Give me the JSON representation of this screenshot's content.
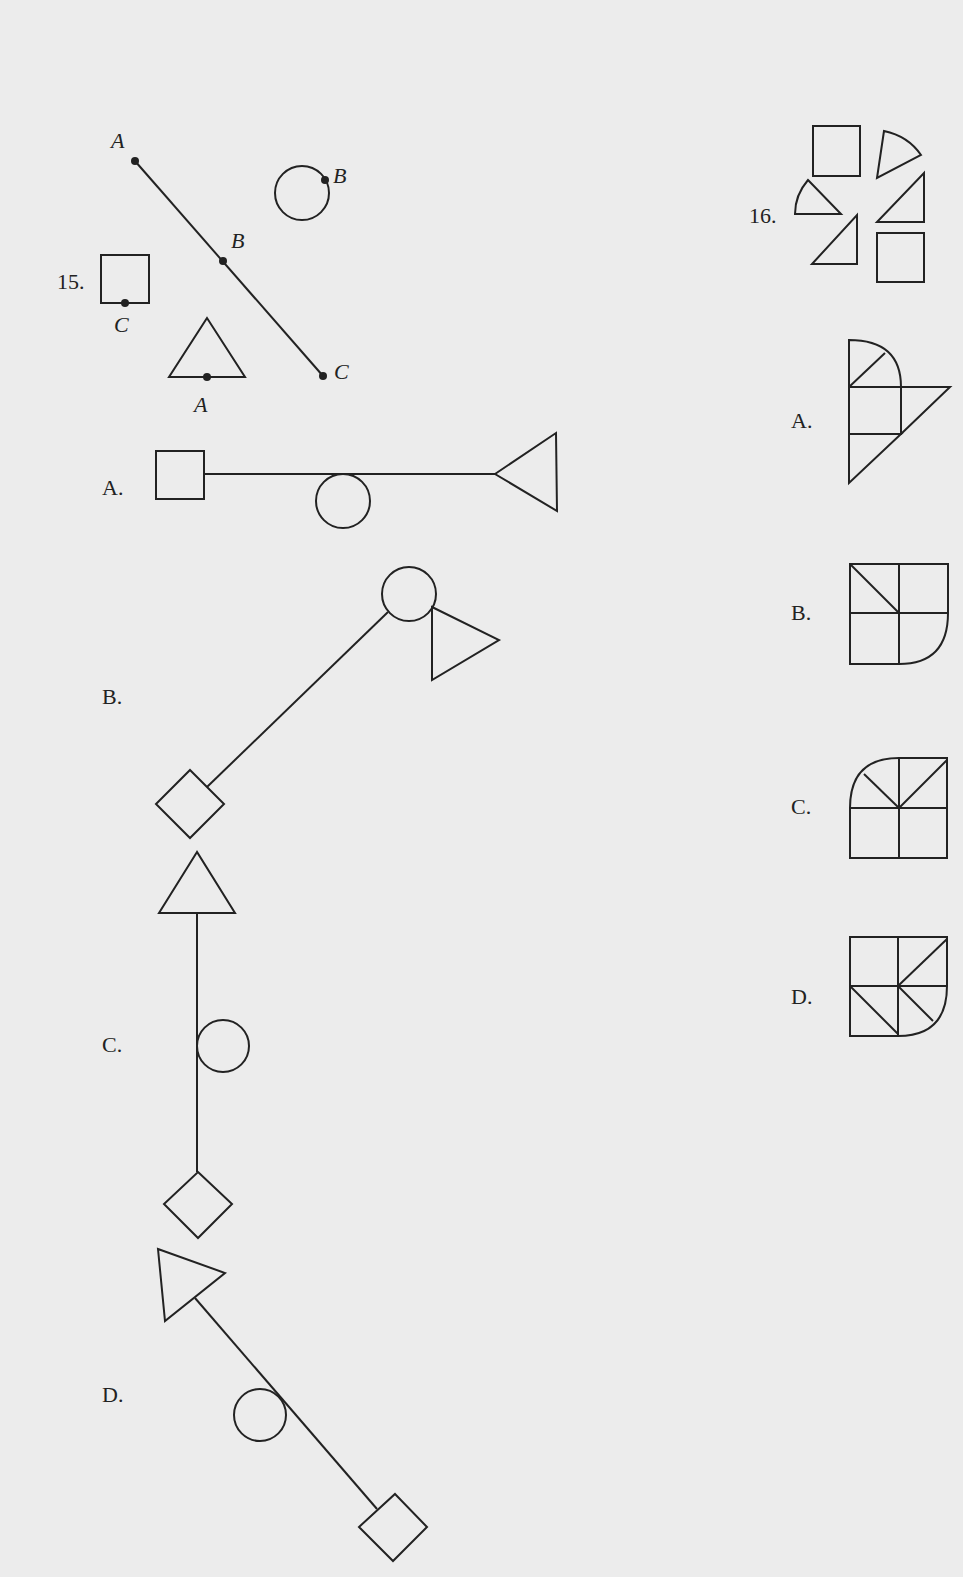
{
  "questions": [
    {
      "number": "15.",
      "prompt_figure": {
        "segment_points": [
          "A",
          "B",
          "C"
        ],
        "shape_labels": {
          "circle": "B",
          "square": "C",
          "triangle": "A"
        }
      },
      "options": [
        {
          "label": "A.",
          "description": "square - line - circle below line - triangle at right end (horizontal)"
        },
        {
          "label": "B.",
          "description": "diamond lower-left - diagonal line - circle top-right with triangle"
        },
        {
          "label": "C.",
          "description": "triangle top - vertical line - circle on right - diamond bottom"
        },
        {
          "label": "D.",
          "description": "triangle top-left - diagonal line - circle left of line - diamond bottom-right"
        }
      ]
    },
    {
      "number": "16.",
      "prompt_figure": {
        "pieces": [
          "square",
          "quarter-circle sector",
          "quarter-circle sector",
          "right triangle",
          "right triangle",
          "square"
        ]
      },
      "options": [
        {
          "label": "A."
        },
        {
          "label": "B."
        },
        {
          "label": "C."
        },
        {
          "label": "D."
        }
      ]
    }
  ],
  "colors": {
    "background": "#ececec",
    "ink": "#222222"
  }
}
